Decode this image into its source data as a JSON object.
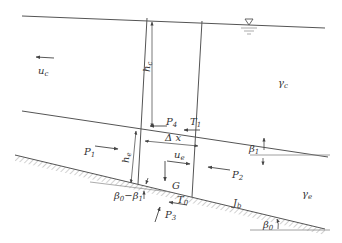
{
  "diagram": {
    "type": "control-volume force diagram (density current on sloping bed)",
    "labels": {
      "uc": {
        "main": "u",
        "sub": "c"
      },
      "hc": {
        "main": "h",
        "sub": "c"
      },
      "gamma_c": {
        "main": "γ",
        "sub": "c"
      },
      "P4": {
        "main": "P",
        "sub": "4"
      },
      "T1": {
        "main": "T",
        "sub": "1"
      },
      "dx": {
        "main": "Δ x",
        "sub": ""
      },
      "P1": {
        "main": "P",
        "sub": "1"
      },
      "he": {
        "main": "h",
        "sub": "e"
      },
      "ue": {
        "main": "u",
        "sub": "e"
      },
      "P2": {
        "main": "P",
        "sub": "2"
      },
      "beta1": {
        "main": "β",
        "sub": "1"
      },
      "gamma_e": {
        "main": "γ",
        "sub": "e"
      },
      "G": {
        "main": "G",
        "sub": ""
      },
      "beta0_minus_beta1": {
        "main": "β",
        "sub": "0",
        "rest": "−β",
        "sub2": "1"
      },
      "T0": {
        "main": "T",
        "sub": "0"
      },
      "P3": {
        "main": "P",
        "sub": "3"
      },
      "Jb": {
        "main": "J",
        "sub": "b"
      },
      "beta0": {
        "main": "β",
        "sub": "0"
      }
    },
    "symbols": {
      "water_surface": "▽"
    },
    "colors": {
      "line": "#555555",
      "text": "#333333",
      "hatch": "#9a9a9a"
    }
  }
}
